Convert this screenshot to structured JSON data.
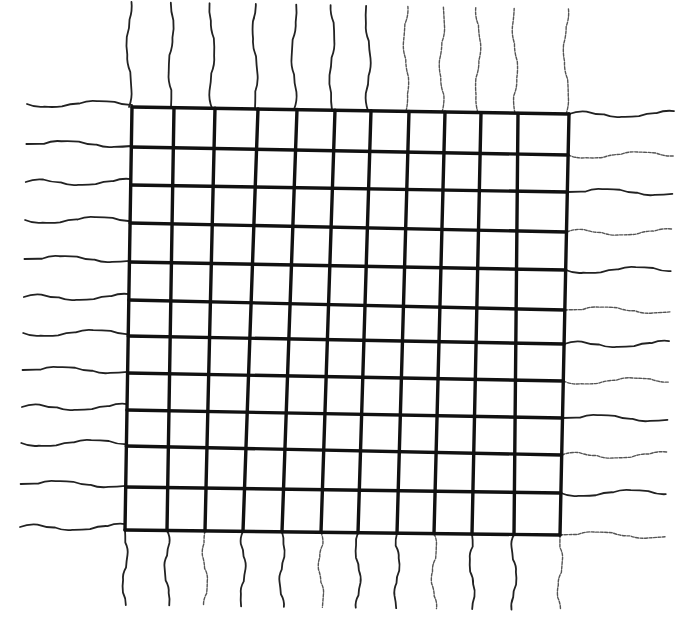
{
  "diagram": {
    "type": "hand-drawn wire grid",
    "background": "#ffffff",
    "ink_color": "#111111",
    "grid": {
      "vertical_count": 12,
      "horizontal_count": 12,
      "vertical_x_top": [
        132,
        174,
        215,
        258,
        297,
        335,
        371,
        409,
        445,
        481,
        518,
        569
      ],
      "vertical_x_bottom": [
        125,
        167,
        205,
        243,
        282,
        321,
        358,
        397,
        434,
        472,
        514,
        560
      ],
      "horizontal_y_left": [
        107,
        147,
        185,
        223,
        262,
        300,
        336,
        373,
        410,
        446,
        487,
        530
      ],
      "horizontal_y_right": [
        114,
        155,
        192,
        232,
        270,
        310,
        344,
        381,
        418,
        455,
        493,
        535
      ],
      "left_x_top": 132,
      "left_x_bottom": 125,
      "right_x_top": 569,
      "right_x_bottom": 560
    },
    "leads": {
      "top": {
        "count": 12,
        "length": 105
      },
      "bottom": {
        "count": 12,
        "length": 75
      },
      "left": {
        "count": 12,
        "length": 105
      },
      "right": {
        "count": 12,
        "length": 105
      }
    }
  }
}
